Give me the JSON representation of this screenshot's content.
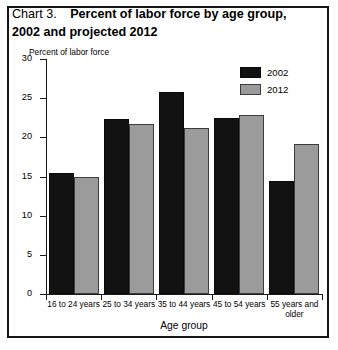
{
  "title": {
    "prefix": "Chart 3.",
    "main": "Percent of labor force by age group,",
    "line2": "2002 and projected 2012"
  },
  "legend": {
    "position": "top-right",
    "items": [
      {
        "label": "2002",
        "color": "#121212",
        "swatch_name": "legend-swatch-2002"
      },
      {
        "label": "2012",
        "color": "#9b9b9b",
        "swatch_name": "legend-swatch-2012"
      }
    ]
  },
  "axes": {
    "ylabel": "Percent of labor force",
    "xlabel": "Age group",
    "yticks": [
      "0",
      "5",
      "10",
      "15",
      "20",
      "25",
      "30"
    ]
  },
  "chart_data": {
    "type": "bar",
    "subtitle": "",
    "xlabel": "Age group",
    "ylabel": "Percent of labor force",
    "ylim": [
      0,
      30
    ],
    "ytick_values": [
      0,
      5,
      10,
      15,
      20,
      25,
      30
    ],
    "grid": false,
    "legend_position": "top-right",
    "categories": [
      "16 to 24 years",
      "25 to 34 years",
      "35 to 44 years",
      "45 to 54 years",
      "55 years and older"
    ],
    "series": [
      {
        "name": "2002",
        "color": "#121212",
        "values": [
          15.5,
          22.3,
          25.8,
          22.5,
          14.4
        ]
      },
      {
        "name": "2012",
        "color": "#9b9b9b",
        "values": [
          15.0,
          21.7,
          21.2,
          22.9,
          19.1
        ]
      }
    ]
  }
}
